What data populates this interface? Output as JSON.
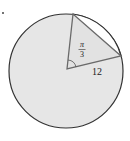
{
  "figure": {
    "type": "circle-sector-triangle",
    "angle_label_numerator": "π",
    "angle_label_denominator": "3",
    "radius_label": "12",
    "colors": {
      "fill": "#e6e6e6",
      "stroke": "#3a3a3a",
      "triangle_stroke": "#666666",
      "segment_fill": "#ffffff"
    }
  }
}
